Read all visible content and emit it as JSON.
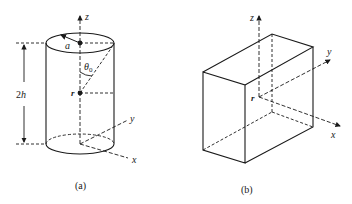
{
  "figure": {
    "panel_a": {
      "caption": "(a)",
      "shape": "cylinder",
      "labels": {
        "z_axis": "z",
        "y_axis": "y",
        "x_axis": "x",
        "radius": "a",
        "angle": "θ",
        "angle_subscript": "0",
        "point": "r",
        "height": "2h"
      }
    },
    "panel_b": {
      "caption": "(b)",
      "shape": "rectangular box",
      "labels": {
        "z_axis": "z",
        "y_axis": "y",
        "x_axis": "x",
        "point": "r"
      }
    }
  },
  "colors": {
    "line": "#1a1a1a",
    "background": "#ffffff"
  }
}
